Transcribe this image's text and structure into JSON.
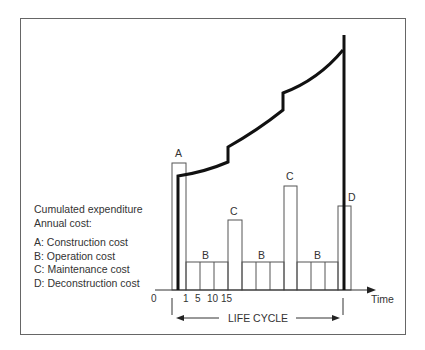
{
  "legend": {
    "title": "Cumulated expenditure",
    "subtitle": "Annual cost:",
    "items": [
      {
        "key": "A",
        "label": "A: Construction cost"
      },
      {
        "key": "B",
        "label": "B: Operation cost"
      },
      {
        "key": "C",
        "label": "C: Maintenance cost"
      },
      {
        "key": "D",
        "label": "D: Deconstruction cost"
      }
    ]
  },
  "bar_labels": {
    "A": "A",
    "B1": "B",
    "C1": "C",
    "B2": "B",
    "C2": "C",
    "B3": "B",
    "D": "D"
  },
  "axis": {
    "origin": "0",
    "ticks": [
      "1",
      "5",
      "10",
      "15"
    ],
    "x_label": "Time",
    "life_cycle_label": "LIFE CYCLE"
  },
  "colors": {
    "line": "#111111",
    "bar_stroke": "#555555",
    "frame": "#666666"
  }
}
